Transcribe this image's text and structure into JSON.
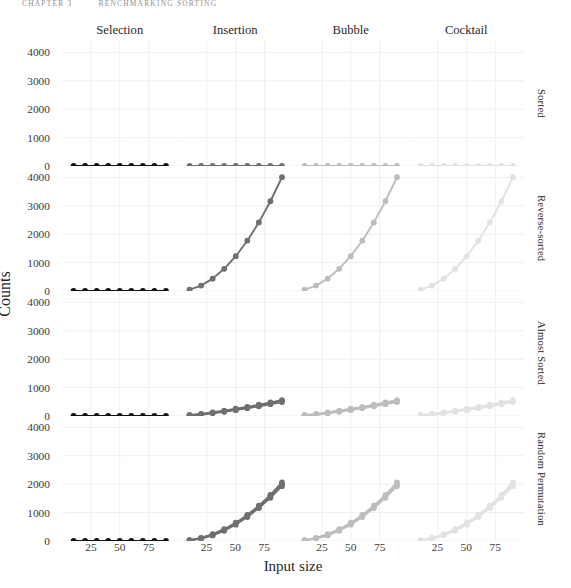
{
  "running_head": {
    "left": "Chapter 3",
    "right": "Benchmarking sorting"
  },
  "axis": {
    "xlabel": "Input size",
    "ylabel": "Counts",
    "xticks": [
      25,
      50,
      75
    ],
    "yticks": [
      0,
      1000,
      2000,
      3000,
      4000
    ],
    "xlim": [
      0,
      100
    ],
    "ylim": [
      0,
      4400
    ]
  },
  "columns": [
    {
      "label": "Selection",
      "color": "#111111"
    },
    {
      "label": "Insertion",
      "color": "#6f6f6f"
    },
    {
      "label": "Bubble",
      "color": "#bdbdbd"
    },
    {
      "label": "Cocktail",
      "color": "#e2e2e2"
    }
  ],
  "rows": [
    {
      "label": "Sorted"
    },
    {
      "label": "Reverse-sorted"
    },
    {
      "label": "Almost Sorted"
    },
    {
      "label": "Random Permutation"
    }
  ],
  "chart_data": {
    "type": "line",
    "title": "",
    "subtitle": "",
    "xlabel": "Input size",
    "ylabel": "Counts",
    "xlim": [
      0,
      100
    ],
    "ylim": [
      0,
      4400
    ],
    "xticks": [
      25,
      50,
      75
    ],
    "yticks": [
      0,
      1000,
      2000,
      3000,
      4000
    ],
    "grid": true,
    "legend": "none",
    "facet_columns": [
      "Selection",
      "Insertion",
      "Bubble",
      "Cocktail"
    ],
    "facet_rows": [
      "Sorted",
      "Reverse-sorted",
      "Almost Sorted",
      "Random Permutation"
    ],
    "x": [
      10,
      20,
      30,
      40,
      50,
      60,
      70,
      80,
      90
    ],
    "panels": [
      {
        "row": "Sorted",
        "column": "Selection",
        "series": [
          {
            "name": "counts",
            "values": [
              0,
              0,
              0,
              0,
              0,
              0,
              0,
              0,
              0
            ]
          }
        ]
      },
      {
        "row": "Sorted",
        "column": "Insertion",
        "series": [
          {
            "name": "counts",
            "values": [
              0,
              0,
              0,
              0,
              0,
              0,
              0,
              0,
              0
            ]
          }
        ]
      },
      {
        "row": "Sorted",
        "column": "Bubble",
        "series": [
          {
            "name": "counts",
            "values": [
              0,
              0,
              0,
              0,
              0,
              0,
              0,
              0,
              0
            ]
          }
        ]
      },
      {
        "row": "Sorted",
        "column": "Cocktail",
        "series": [
          {
            "name": "counts",
            "values": [
              0,
              0,
              0,
              0,
              0,
              0,
              0,
              0,
              0
            ]
          }
        ]
      },
      {
        "row": "Reverse-sorted",
        "column": "Selection",
        "series": [
          {
            "name": "counts",
            "values": [
              0,
              0,
              0,
              0,
              0,
              0,
              0,
              0,
              0
            ]
          }
        ]
      },
      {
        "row": "Reverse-sorted",
        "column": "Insertion",
        "series": [
          {
            "name": "counts",
            "values": [
              45,
              190,
              435,
              780,
              1225,
              1770,
              2415,
              3160,
              4005
            ]
          }
        ]
      },
      {
        "row": "Reverse-sorted",
        "column": "Bubble",
        "series": [
          {
            "name": "counts",
            "values": [
              45,
              190,
              435,
              780,
              1225,
              1770,
              2415,
              3160,
              4005
            ]
          }
        ]
      },
      {
        "row": "Reverse-sorted",
        "column": "Cocktail",
        "series": [
          {
            "name": "counts",
            "values": [
              45,
              190,
              435,
              780,
              1225,
              1770,
              2415,
              3160,
              4005
            ]
          }
        ]
      },
      {
        "row": "Almost Sorted",
        "column": "Selection",
        "series": [
          {
            "name": "counts",
            "values": [
              0,
              0,
              0,
              0,
              0,
              0,
              0,
              0,
              0
            ]
          }
        ]
      },
      {
        "row": "Almost Sorted",
        "column": "Insertion",
        "series": [
          {
            "name": "rep1",
            "values": [
              20,
              60,
              110,
              165,
              225,
              295,
              365,
              440,
              520
            ]
          },
          {
            "name": "rep2",
            "values": [
              35,
              75,
              130,
              190,
              255,
              320,
              400,
              480,
              560
            ]
          },
          {
            "name": "rep3",
            "values": [
              10,
              45,
              95,
              150,
              205,
              275,
              340,
              415,
              490
            ]
          }
        ]
      },
      {
        "row": "Almost Sorted",
        "column": "Bubble",
        "series": [
          {
            "name": "rep1",
            "values": [
              20,
              60,
              110,
              165,
              225,
              295,
              365,
              440,
              520
            ]
          },
          {
            "name": "rep2",
            "values": [
              35,
              75,
              130,
              190,
              255,
              320,
              400,
              480,
              560
            ]
          },
          {
            "name": "rep3",
            "values": [
              10,
              45,
              95,
              150,
              205,
              275,
              340,
              415,
              490
            ]
          }
        ]
      },
      {
        "row": "Almost Sorted",
        "column": "Cocktail",
        "series": [
          {
            "name": "rep1",
            "values": [
              20,
              60,
              110,
              165,
              225,
              295,
              365,
              440,
              520
            ]
          },
          {
            "name": "rep2",
            "values": [
              35,
              75,
              130,
              190,
              255,
              320,
              400,
              480,
              560
            ]
          },
          {
            "name": "rep3",
            "values": [
              10,
              45,
              95,
              150,
              205,
              275,
              340,
              415,
              490
            ]
          }
        ]
      },
      {
        "row": "Random Permutation",
        "column": "Selection",
        "series": [
          {
            "name": "counts",
            "values": [
              0,
              0,
              0,
              0,
              0,
              0,
              0,
              0,
              0
            ]
          }
        ]
      },
      {
        "row": "Random Permutation",
        "column": "Insertion",
        "series": [
          {
            "name": "rep1",
            "values": [
              25,
              100,
              220,
              390,
              610,
              880,
              1200,
              1570,
              1990
            ]
          },
          {
            "name": "rep2",
            "values": [
              18,
              85,
              195,
              360,
              575,
              845,
              1160,
              1520,
              1930
            ]
          },
          {
            "name": "rep3",
            "values": [
              30,
              110,
              240,
              415,
              645,
              915,
              1245,
              1620,
              2060
            ]
          }
        ]
      },
      {
        "row": "Random Permutation",
        "column": "Bubble",
        "series": [
          {
            "name": "rep1",
            "values": [
              25,
              100,
              220,
              390,
              610,
              880,
              1200,
              1570,
              1990
            ]
          },
          {
            "name": "rep2",
            "values": [
              18,
              85,
              195,
              360,
              575,
              845,
              1160,
              1520,
              1930
            ]
          },
          {
            "name": "rep3",
            "values": [
              30,
              110,
              240,
              415,
              645,
              915,
              1245,
              1620,
              2060
            ]
          }
        ]
      },
      {
        "row": "Random Permutation",
        "column": "Cocktail",
        "series": [
          {
            "name": "rep1",
            "values": [
              25,
              100,
              220,
              390,
              610,
              880,
              1200,
              1570,
              1990
            ]
          },
          {
            "name": "rep2",
            "values": [
              18,
              85,
              195,
              360,
              575,
              845,
              1160,
              1520,
              1930
            ]
          },
          {
            "name": "rep3",
            "values": [
              30,
              110,
              240,
              415,
              645,
              915,
              1245,
              1620,
              2060
            ]
          }
        ]
      }
    ]
  }
}
